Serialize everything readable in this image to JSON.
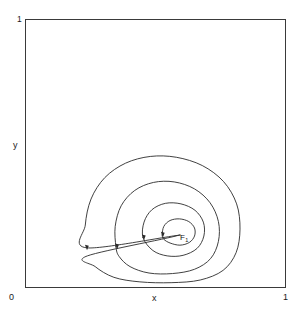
{
  "figure": {
    "title": "",
    "axes": {
      "x_label": "x",
      "y_label": "y",
      "x_min_label": "0",
      "x_max_label": "1",
      "y_max_label": "1",
      "frame_color": "#3a3a3a"
    },
    "annotations": {
      "fixed_point_name": "F",
      "fixed_point_sub": "1"
    }
  },
  "chart_data": {
    "type": "line",
    "title": "",
    "xlabel": "x",
    "ylabel": "y",
    "xlim": [
      0,
      1
    ],
    "ylim": [
      0,
      1
    ],
    "grid": false,
    "legend": "none",
    "tick_labels": {
      "x": [
        "0",
        "1"
      ],
      "y": [
        "0",
        "1"
      ]
    },
    "annotations": [
      {
        "text": "F",
        "subscript": "1",
        "x": 0.595,
        "y": 0.196,
        "type": "fixed-point"
      }
    ],
    "series": [
      {
        "name": "orbit-4-outer",
        "closed": true,
        "arrow_at": {
          "x": 0.236,
          "y": 0.148
        },
        "points": [
          [
            0.595,
            0.196
          ],
          [
            0.236,
            0.148
          ],
          [
            0.23,
            0.233
          ],
          [
            0.252,
            0.33
          ],
          [
            0.305,
            0.41
          ],
          [
            0.385,
            0.464
          ],
          [
            0.48,
            0.489
          ],
          [
            0.58,
            0.486
          ],
          [
            0.68,
            0.455
          ],
          [
            0.762,
            0.395
          ],
          [
            0.812,
            0.312
          ],
          [
            0.825,
            0.218
          ],
          [
            0.81,
            0.13
          ],
          [
            0.76,
            0.064
          ],
          [
            0.672,
            0.028
          ],
          [
            0.56,
            0.018
          ],
          [
            0.44,
            0.021
          ],
          [
            0.34,
            0.038
          ],
          [
            0.268,
            0.078
          ],
          [
            0.238,
            0.118
          ]
        ]
      },
      {
        "name": "orbit-3",
        "closed": true,
        "arrow_at": {
          "x": 0.352,
          "y": 0.152
        },
        "points": [
          [
            0.348,
            0.152
          ],
          [
            0.345,
            0.228
          ],
          [
            0.368,
            0.305
          ],
          [
            0.42,
            0.362
          ],
          [
            0.492,
            0.392
          ],
          [
            0.572,
            0.394
          ],
          [
            0.65,
            0.368
          ],
          [
            0.71,
            0.316
          ],
          [
            0.742,
            0.246
          ],
          [
            0.742,
            0.172
          ],
          [
            0.712,
            0.108
          ],
          [
            0.65,
            0.068
          ],
          [
            0.565,
            0.052
          ],
          [
            0.475,
            0.054
          ],
          [
            0.402,
            0.078
          ],
          [
            0.36,
            0.116
          ]
        ]
      },
      {
        "name": "orbit-2",
        "closed": true,
        "arrow_at": {
          "x": 0.455,
          "y": 0.186
        },
        "points": [
          [
            0.452,
            0.186
          ],
          [
            0.456,
            0.244
          ],
          [
            0.486,
            0.29
          ],
          [
            0.538,
            0.314
          ],
          [
            0.598,
            0.312
          ],
          [
            0.652,
            0.288
          ],
          [
            0.684,
            0.244
          ],
          [
            0.686,
            0.192
          ],
          [
            0.66,
            0.146
          ],
          [
            0.606,
            0.12
          ],
          [
            0.545,
            0.118
          ],
          [
            0.49,
            0.138
          ]
        ]
      },
      {
        "name": "orbit-1-inner",
        "closed": true,
        "arrow_at": {
          "x": 0.528,
          "y": 0.196
        },
        "points": [
          [
            0.526,
            0.196
          ],
          [
            0.532,
            0.228
          ],
          [
            0.556,
            0.25
          ],
          [
            0.592,
            0.256
          ],
          [
            0.628,
            0.246
          ],
          [
            0.65,
            0.222
          ],
          [
            0.65,
            0.192
          ],
          [
            0.63,
            0.168
          ],
          [
            0.594,
            0.158
          ],
          [
            0.556,
            0.166
          ],
          [
            0.532,
            0.18
          ]
        ]
      }
    ]
  }
}
